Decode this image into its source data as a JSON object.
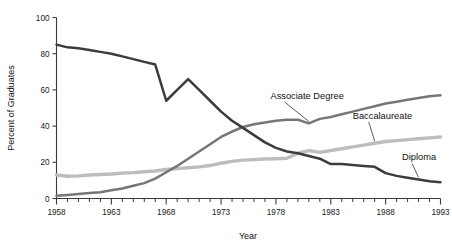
{
  "chart_data": {
    "type": "line",
    "title": "",
    "subtitle": "",
    "xlabel": "Year",
    "ylabel": "Percent of Graduates",
    "xlim": [
      1958,
      1993
    ],
    "ylim": [
      0,
      100
    ],
    "grid": false,
    "legend_position": "inline-annotations",
    "x_ticks_major": [
      1958,
      1963,
      1968,
      1973,
      1978,
      1983,
      1988,
      1993
    ],
    "x_tick_labels": [
      "1958",
      "1963",
      "1968",
      "1973",
      "1978",
      "1983",
      "1988",
      "1993"
    ],
    "x_minor_tick_step": 1,
    "y_ticks": [
      0,
      20,
      40,
      60,
      80,
      100
    ],
    "y_tick_labels": [
      "0",
      "20",
      "40",
      "60",
      "80",
      "100"
    ],
    "x": [
      1958,
      1959,
      1960,
      1961,
      1962,
      1963,
      1964,
      1965,
      1966,
      1967,
      1968,
      1969,
      1970,
      1971,
      1972,
      1973,
      1974,
      1975,
      1976,
      1977,
      1978,
      1979,
      1980,
      1981,
      1982,
      1983,
      1984,
      1985,
      1986,
      1987,
      1988,
      1989,
      1990,
      1991,
      1992,
      1993
    ],
    "series": [
      {
        "name": "Diploma",
        "color": "#3c3c3c",
        "label_position": {
          "x": 1989.5,
          "y": 21
        },
        "values": [
          85,
          83.5,
          83,
          82,
          81,
          80,
          78.5,
          77,
          75.5,
          74,
          54,
          60,
          66,
          60,
          54,
          48,
          43,
          39,
          35,
          31,
          28,
          26,
          25,
          23.5,
          22,
          19,
          19,
          18.5,
          18,
          17.5,
          14,
          12.5,
          11.5,
          10.5,
          9.5,
          9
        ]
      },
      {
        "name": "Baccalaureate",
        "color": "#bdbdbd",
        "label_position": {
          "x": 1985,
          "y": 44
        },
        "values": [
          13,
          12.3,
          12.5,
          13,
          13.3,
          13.5,
          14,
          14.3,
          14.8,
          15.2,
          16,
          16.5,
          17,
          17.5,
          18.2,
          19.5,
          20.5,
          21.2,
          21.5,
          21.8,
          22,
          22.2,
          25,
          26.5,
          25.5,
          26.5,
          27.5,
          28.5,
          29.5,
          30.5,
          31.5,
          32,
          32.5,
          33,
          33.5,
          34
        ]
      },
      {
        "name": "Associate Degree",
        "color": "#767676",
        "label_position": {
          "x": 1977.5,
          "y": 55
        },
        "values": [
          1.5,
          2,
          2.5,
          3,
          3.5,
          4.5,
          5.5,
          7,
          8.5,
          11,
          14.5,
          18,
          22,
          26,
          30,
          34,
          37,
          39.5,
          41,
          42,
          43,
          43.5,
          43.5,
          41.5,
          44,
          45,
          46.5,
          48,
          49.5,
          51,
          52.5,
          53.5,
          54.5,
          55.5,
          56.5,
          57
        ]
      }
    ]
  },
  "annotations": {
    "associate_degree_label": "Associate Degree",
    "baccalaureate_label": "Baccalaureate",
    "diploma_label": "Diploma"
  },
  "axes": {
    "y_title": "Percent of Graduates",
    "x_title": "Year"
  }
}
